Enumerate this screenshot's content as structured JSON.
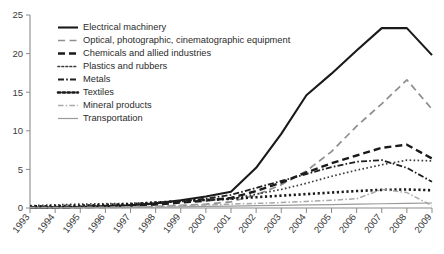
{
  "chart_data": {
    "type": "line",
    "title": "",
    "xlabel": "",
    "ylabel": "",
    "xlim": [
      1993,
      2009
    ],
    "ylim": [
      0,
      25
    ],
    "grid": false,
    "legend_position": "upper-left-inside",
    "x": [
      1993,
      1994,
      1995,
      1996,
      1997,
      1998,
      1999,
      2000,
      2001,
      2002,
      2003,
      2004,
      2005,
      2006,
      2007,
      2008,
      2009
    ],
    "yticks": [
      0,
      5,
      10,
      15,
      20,
      25
    ],
    "xticks": [
      "1993",
      "1994",
      "1995",
      "1996",
      "1997",
      "1998",
      "1999",
      "2000",
      "2001",
      "2002",
      "2003",
      "2004",
      "2005",
      "2006",
      "2007",
      "2008",
      "2009"
    ],
    "series": [
      {
        "name": "Electrical machinery",
        "style": "solid",
        "color": "#1a1a1a",
        "width": 2.1,
        "values": [
          0.05,
          0.08,
          0.12,
          0.2,
          0.35,
          0.6,
          1.0,
          1.5,
          2.1,
          5.2,
          9.6,
          14.6,
          17.4,
          20.4,
          23.3,
          23.3,
          19.8
        ]
      },
      {
        "name": "Optical, photographic, cinematographic equipment",
        "style": "dashed",
        "color": "#8e8e8e",
        "width": 1.7,
        "values": [
          0.02,
          0.03,
          0.04,
          0.06,
          0.1,
          0.2,
          0.35,
          0.5,
          0.8,
          1.7,
          3.0,
          4.8,
          7.3,
          10.6,
          13.5,
          16.6,
          12.8
        ]
      },
      {
        "name": "Chemicals and allied industries",
        "style": "dashed-bold",
        "color": "#1a1a1a",
        "width": 2.4,
        "values": [
          0.05,
          0.08,
          0.12,
          0.2,
          0.3,
          0.45,
          0.7,
          0.95,
          1.3,
          2.2,
          3.3,
          4.6,
          5.8,
          6.8,
          7.8,
          8.2,
          6.4
        ]
      },
      {
        "name": "Plastics and rubbers",
        "style": "dotted",
        "color": "#3a3a3a",
        "width": 1.7,
        "values": [
          0.3,
          0.4,
          0.5,
          0.55,
          0.6,
          0.75,
          0.85,
          1.0,
          1.2,
          1.8,
          2.4,
          3.2,
          4.1,
          4.9,
          5.6,
          6.2,
          6.1
        ]
      },
      {
        "name": "Metals",
        "style": "dashdot",
        "color": "#1f1f1f",
        "width": 1.8,
        "values": [
          0.1,
          0.15,
          0.2,
          0.3,
          0.4,
          0.6,
          0.9,
          1.2,
          1.7,
          2.6,
          3.5,
          4.4,
          5.3,
          6.0,
          6.2,
          5.2,
          3.4
        ]
      },
      {
        "name": "Textiles",
        "style": "dotted-bold",
        "color": "#1a1a1a",
        "width": 2.6,
        "values": [
          0.2,
          0.25,
          0.3,
          0.4,
          0.5,
          0.7,
          0.9,
          1.05,
          1.2,
          1.4,
          1.6,
          1.8,
          2.0,
          2.2,
          2.35,
          2.4,
          2.3
        ]
      },
      {
        "name": "Mineral products",
        "style": "dashdot-light",
        "color": "#a9a9a9",
        "width": 1.5,
        "values": [
          0.05,
          0.05,
          0.08,
          0.1,
          0.15,
          0.2,
          0.3,
          0.4,
          0.5,
          0.6,
          0.7,
          0.85,
          1.0,
          1.2,
          2.4,
          2.0,
          0.3
        ]
      },
      {
        "name": "Transportation",
        "style": "solid-thin",
        "color": "#9a9a9a",
        "width": 1.2,
        "values": [
          0.02,
          0.03,
          0.04,
          0.05,
          0.07,
          0.1,
          0.15,
          0.2,
          0.25,
          0.3,
          0.35,
          0.4,
          0.45,
          0.5,
          0.55,
          0.6,
          0.65
        ]
      }
    ]
  }
}
